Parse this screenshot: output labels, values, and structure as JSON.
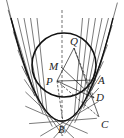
{
  "diagram": {
    "type": "geometry",
    "colors": {
      "stroke": "#222222",
      "background": "#ffffff"
    },
    "points": [
      {
        "id": "Q",
        "label": "Q",
        "x": 74,
        "y": 48,
        "lx": 70,
        "ly": 45
      },
      {
        "id": "M",
        "label": "M",
        "x": 61,
        "y": 67,
        "lx": 49,
        "ly": 70
      },
      {
        "id": "P",
        "label": "P",
        "x": 57,
        "y": 81,
        "lx": 46,
        "ly": 85
      },
      {
        "id": "A",
        "label": "A",
        "x": 96,
        "y": 80,
        "lx": 98,
        "ly": 84
      },
      {
        "id": "D",
        "label": "D",
        "x": 94,
        "y": 98,
        "lx": 96,
        "ly": 101
      },
      {
        "id": "B",
        "label": "B",
        "x": 63,
        "y": 122,
        "lx": 58,
        "ly": 133
      },
      {
        "id": "C",
        "label": "C",
        "x": 99,
        "y": 117,
        "lx": 101,
        "ly": 128
      }
    ],
    "circle": {
      "cx": 64,
      "cy": 65,
      "r": 32
    },
    "axis": {
      "x": 62,
      "y1": 10,
      "y2": 136,
      "style": "dashed"
    },
    "parabola": {
      "vertex_x": 62,
      "vertex_y": 121,
      "top_y": 18,
      "half_width": 51
    }
  }
}
